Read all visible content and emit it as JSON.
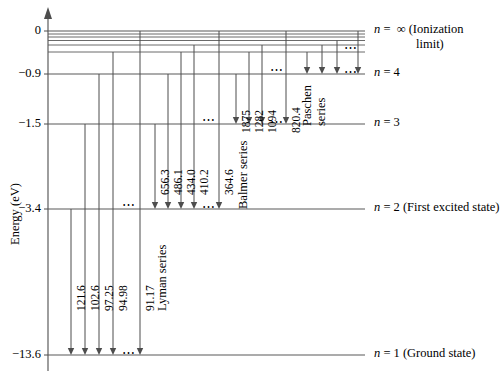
{
  "figure": {
    "axis": {
      "ylabel": "Energy (eV)",
      "ticks": [
        {
          "value": 0,
          "label": "0",
          "y": 31
        },
        {
          "value": -0.9,
          "label": "−0.9",
          "y": 74
        },
        {
          "value": -1.5,
          "label": "−1.5",
          "y": 124
        },
        {
          "value": -3.4,
          "label": "−3.4",
          "y": 209
        },
        {
          "value": -13.6,
          "label": "−13.6",
          "y": 355
        }
      ]
    },
    "levels": [
      {
        "name": "n-infinity",
        "label_n": "n",
        "label_eq": "=",
        "label_value": "∞",
        "label_note": "(Ionization",
        "label_note2": "limit)",
        "y": 31,
        "energy_ev": 0
      },
      {
        "name": "n-4",
        "label_n": "n",
        "label_eq": "=",
        "label_value": "4",
        "label_note": "",
        "y": 74,
        "energy_ev": -0.85
      },
      {
        "name": "n-3",
        "label_n": "n",
        "label_eq": "=",
        "label_value": "3",
        "label_note": "",
        "y": 124,
        "energy_ev": -1.5
      },
      {
        "name": "n-2",
        "label_n": "n",
        "label_eq": "=",
        "label_value": "2",
        "label_note": "(First excited state)",
        "y": 209,
        "energy_ev": -3.4
      },
      {
        "name": "n-1",
        "label_n": "n",
        "label_eq": "=",
        "label_value": "1",
        "label_note": "(Ground state)",
        "y": 355,
        "energy_ev": -13.6
      }
    ],
    "converging_levels_y": [
      31,
      34,
      37,
      40.5,
      45,
      52
    ],
    "series": [
      {
        "name": "Lyman series",
        "label": "Lyman series",
        "final_level": 1,
        "transitions": [
          {
            "wavelength": "121.6",
            "x": 71,
            "from_y": 209
          },
          {
            "wavelength": "102.6",
            "x": 85,
            "from_y": 124
          },
          {
            "wavelength": "97.25",
            "x": 99,
            "from_y": 74
          },
          {
            "wavelength": "94.98",
            "x": 113,
            "from_y": 52
          },
          {
            "wavelength": "91.17",
            "x": 140,
            "from_y": 31
          }
        ],
        "ellipsis_x": 126,
        "ellipsis_top_y": 209
      },
      {
        "name": "Balmer series",
        "label": "Balmer series",
        "final_level": 2,
        "transitions": [
          {
            "wavelength": "656.3",
            "x": 155,
            "from_y": 124
          },
          {
            "wavelength": "486.1",
            "x": 168,
            "from_y": 74
          },
          {
            "wavelength": "434.0",
            "x": 181,
            "from_y": 52
          },
          {
            "wavelength": "410.2",
            "x": 194,
            "from_y": 45
          },
          {
            "wavelength": "364.6",
            "x": 219,
            "from_y": 31
          }
        ],
        "ellipsis_x": 206,
        "ellipsis_top_y": 124
      },
      {
        "name": "Paschen series",
        "label_line1": "Paschen",
        "label_line2": "series",
        "final_level": 3,
        "transitions": [
          {
            "wavelength": "1875",
            "x": 236,
            "from_y": 74
          },
          {
            "wavelength": "1282",
            "x": 249,
            "from_y": 52
          },
          {
            "wavelength": "1094",
            "x": 262,
            "from_y": 45
          },
          {
            "wavelength": "820.4",
            "x": 286,
            "from_y": 31
          }
        ],
        "ellipsis_x": 274,
        "ellipsis_top_y": 74
      },
      {
        "name": "Brackett series",
        "label": "",
        "final_level": 4,
        "transitions": [
          {
            "wavelength": "",
            "x": 307,
            "from_y": 52
          },
          {
            "wavelength": "",
            "x": 322,
            "from_y": 45
          },
          {
            "wavelength": "",
            "x": 337,
            "from_y": 40.5
          },
          {
            "wavelength": "",
            "x": 358,
            "from_y": 31
          }
        ],
        "ellipsis_x": 348,
        "ellipsis_top_y": 52
      }
    ],
    "colors": {
      "line": "#4d4d4d",
      "level": "#595959",
      "text": "#000000"
    }
  }
}
